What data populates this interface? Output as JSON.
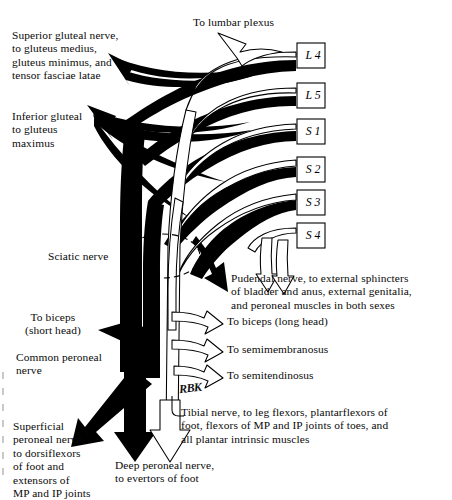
{
  "figure": {
    "signature": "RBK",
    "colors": {
      "ink": "#000000",
      "paper": "#ffffff",
      "dark_branch": "#000000",
      "light_branch": "#ffffff",
      "outline": "#000000"
    }
  },
  "roots": [
    {
      "id": "root-l4",
      "prefix": "L",
      "number": "4",
      "label": "L 4",
      "x": 297,
      "y": 43
    },
    {
      "id": "root-l5",
      "prefix": "L",
      "number": "5",
      "label": "L 5",
      "x": 297,
      "y": 83
    },
    {
      "id": "root-s1",
      "prefix": "S",
      "number": "1",
      "label": "S 1",
      "x": 297,
      "y": 119
    },
    {
      "id": "root-s2",
      "prefix": "S",
      "number": "2",
      "label": "S 2",
      "x": 297,
      "y": 157
    },
    {
      "id": "root-s3",
      "prefix": "S",
      "number": "3",
      "label": "S 3",
      "x": 297,
      "y": 190
    },
    {
      "id": "root-s4",
      "prefix": "S",
      "number": "4",
      "label": "S 4",
      "x": 297,
      "y": 223
    }
  ],
  "labels": {
    "lumbar_plexus": "To lumbar plexus",
    "superior_gluteal": "Superior gluteal nerve,\nto gluteus medius,\ngluteus minimus, and\ntensor fasciae latae",
    "inferior_gluteal": "Inferior gluteal\nto gluteus\nmaximus",
    "sciatic": "Sciatic nerve",
    "pudendal": "Pudendal nerve, to external sphincters\nof bladder and anus, external genitalia,\nand peroneal muscles in both sexes",
    "biceps_long_head": "To biceps (long head)",
    "semimembranosus": "To semimembranosus",
    "semitendinosus": "To semitendinosus",
    "biceps_short_head": "To biceps\n(short head)",
    "common_peroneal": "Common peroneal\nnerve",
    "superficial_peroneal": "Superficial\nperoneal nerve,\nto dorsiflexors\nof foot and\nextensors of\nMP and IP joints",
    "deep_peroneal": "Deep peroneal nerve,\nto evertors of foot",
    "tibial": "Tibial nerve, to leg flexors, plantarflexors of\nfoot, flexors of MP and IP joints of toes, and\nall plantar intrinsic muscles"
  }
}
